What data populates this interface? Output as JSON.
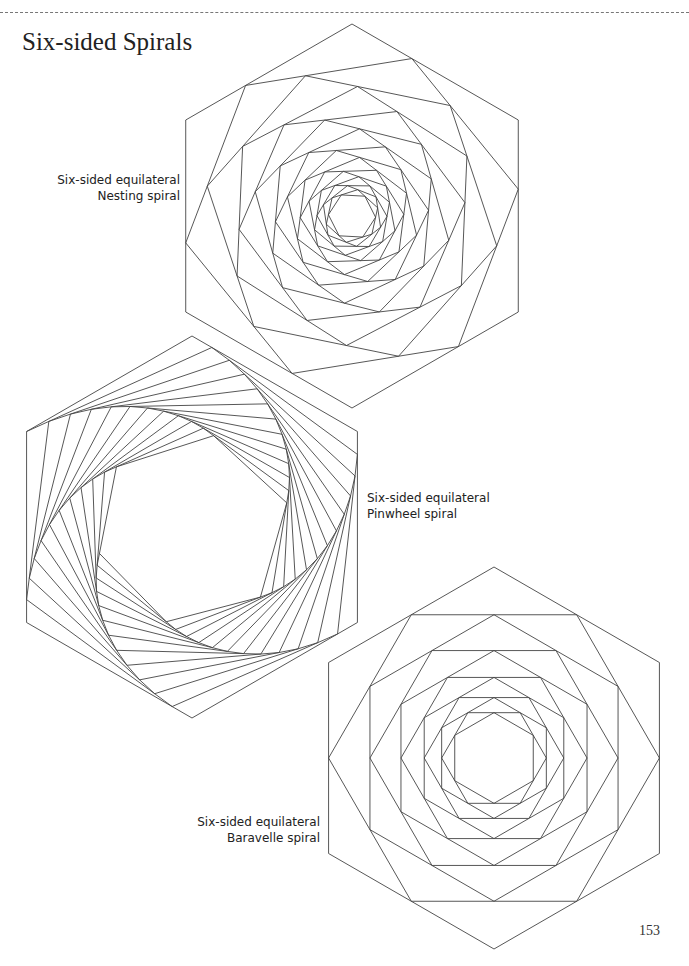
{
  "page": {
    "title": "Six-sided Spirals",
    "page_number": "153"
  },
  "figures": [
    {
      "id": "nesting",
      "label_line1": "Six-sided equilateral",
      "label_line2": "Nesting spiral",
      "center": [
        352,
        216
      ],
      "radius": 192,
      "rotation_deg": -90,
      "steps": 16,
      "fraction": 0.36,
      "type": "nesting"
    },
    {
      "id": "pinwheel",
      "label_line1": "Six-sided equilateral",
      "label_line2": "Pinwheel spiral",
      "center": [
        192,
        527
      ],
      "radius": 191,
      "rotation_deg": -90,
      "steps": 70,
      "fraction": 0.12,
      "type": "pinwheel"
    },
    {
      "id": "baravelle",
      "label_line1": "Six-sided equilateral",
      "label_line2": "Baravelle spiral",
      "center": [
        494,
        758
      ],
      "radius": 191,
      "rotation_deg": -90,
      "steps": 10,
      "fraction": 0.5,
      "type": "baravelle"
    }
  ]
}
